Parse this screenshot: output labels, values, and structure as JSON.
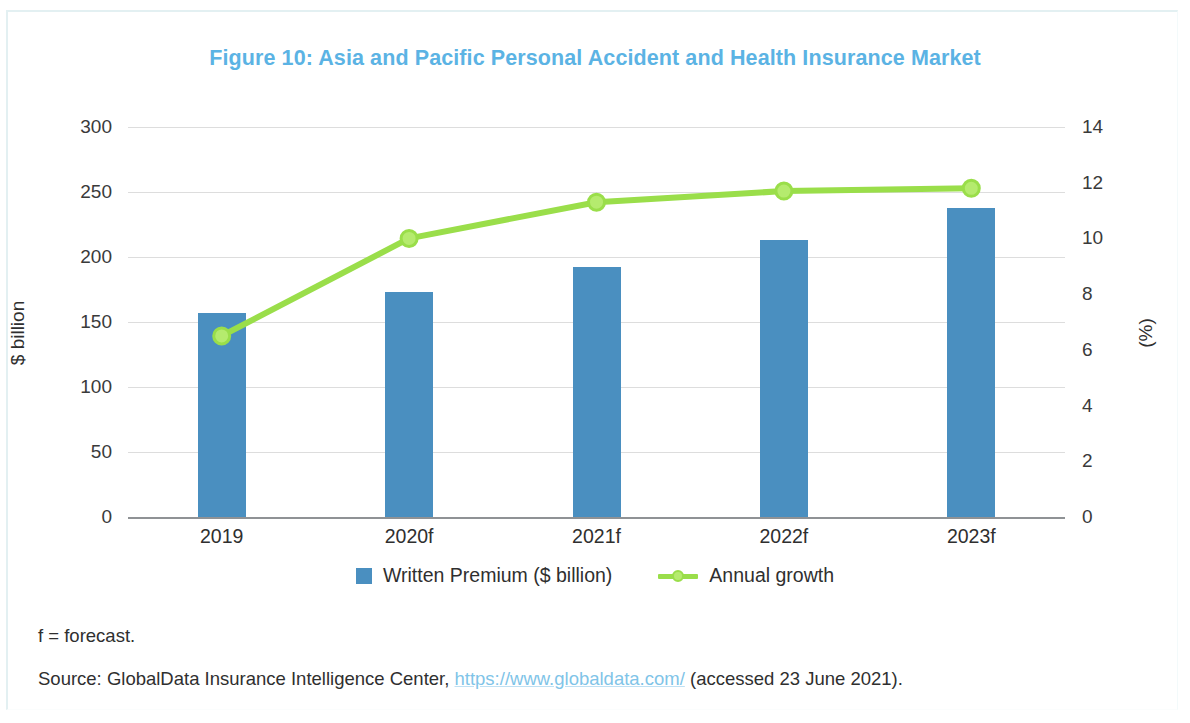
{
  "figure": {
    "title": "Figure 10: Asia and Pacific Personal Accident and Health Insurance Market",
    "title_color": "#5bb3e4"
  },
  "footnotes": {
    "forecast_note": "f = forecast.",
    "source_prefix": "Source: GlobalData Insurance Intelligence Center, ",
    "source_link": "https://www.globaldata.com/",
    "source_suffix": " (accessed 23 June 2021)."
  },
  "legend": {
    "items": [
      {
        "label": "Written Premium ($ billion)",
        "marker": "square-swatch",
        "color": "#4a8fc0"
      },
      {
        "label": "Annual growth",
        "marker": "line-with-dot",
        "color": "#9ade4a"
      }
    ]
  },
  "chart_data": {
    "type": "bar",
    "title": "Figure 10: Asia and Pacific Personal Accident and Health Insurance Market",
    "categories": [
      "2019",
      "2020f",
      "2021f",
      "2022f",
      "2023f"
    ],
    "xlabel": "",
    "ylabel": "$ billion",
    "ylabel_secondary": "(%)",
    "ylim": [
      0,
      300
    ],
    "ylim_secondary": [
      0,
      14
    ],
    "yticks": [
      0,
      50,
      100,
      150,
      200,
      250,
      300
    ],
    "yticks_secondary": [
      0,
      2,
      4,
      6,
      8,
      10,
      12,
      14
    ],
    "grid": true,
    "legend_position": "bottom",
    "series": [
      {
        "name": "Written Premium ($ billion)",
        "type": "bar",
        "axis": "left",
        "color": "#4a8fc0",
        "values": [
          157,
          173,
          192,
          213,
          238
        ]
      },
      {
        "name": "Annual growth",
        "type": "line",
        "axis": "right",
        "color": "#9ade4a",
        "unit": "%",
        "values": [
          6.5,
          10.0,
          11.3,
          11.7,
          11.8
        ]
      }
    ]
  }
}
